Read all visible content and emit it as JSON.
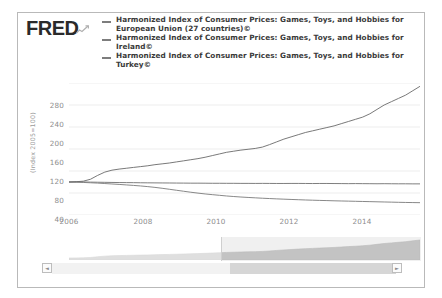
{
  "brand": {
    "logo_text": "FRED",
    "mark_icon": "mini-line-chart-icon"
  },
  "legend": {
    "position": "top",
    "entries": [
      {
        "marker": "line-dash",
        "label": "Harmonized Index of Consumer Prices: Games, Toys, and Hobbies for European Union (27 countries)©"
      },
      {
        "marker": "line-dash",
        "label": "Harmonized Index of Consumer Prices: Games, Toys, and Hobbies for Ireland©"
      },
      {
        "marker": "line-dash",
        "label": "Harmonized Index of Consumer Prices: Games, Toys, and Hobbies for Turkey©"
      }
    ]
  },
  "axis": {
    "y_label": "(Index 2005=100)",
    "y_ticks": [
      "280",
      "240",
      "200",
      "160",
      "120",
      "80",
      "40"
    ],
    "x_ticks": [
      "2006",
      "2008",
      "2010",
      "2012",
      "2014"
    ]
  },
  "navigator": {
    "scroll_left_label": "◄",
    "scroll_right_label": "►",
    "selection_start": "2010",
    "selection_end": "2015"
  },
  "colors": {
    "series_eu": "#6f6f6f",
    "series_ireland": "#7a7a7a",
    "series_turkey": "#6a6a6a",
    "gridline": "#ededed",
    "axis_text": "#8d8d8d",
    "frame": "#b9b9b9",
    "navigator_area": "#c9c9c9"
  },
  "chart_data": {
    "type": "line",
    "title": "",
    "xlabel": "",
    "ylabel": "(Index 2005=100)",
    "xlim": [
      2005.6,
      2015.4
    ],
    "ylim": [
      40,
      280
    ],
    "grid": true,
    "legend_position": "top",
    "x": [
      2005.6,
      2005.8,
      2006.0,
      2006.2,
      2006.4,
      2006.6,
      2006.8,
      2007.0,
      2007.2,
      2007.4,
      2007.6,
      2007.8,
      2008.0,
      2008.2,
      2008.4,
      2008.6,
      2008.8,
      2009.0,
      2009.2,
      2009.4,
      2009.6,
      2009.8,
      2010.0,
      2010.2,
      2010.4,
      2010.6,
      2010.8,
      2011.0,
      2011.2,
      2011.4,
      2011.6,
      2011.8,
      2012.0,
      2012.2,
      2012.4,
      2012.6,
      2012.8,
      2013.0,
      2013.2,
      2013.4,
      2013.6,
      2013.8,
      2014.0,
      2014.2,
      2014.4,
      2014.6,
      2014.8,
      2015.0,
      2015.2,
      2015.4
    ],
    "series": [
      {
        "name": "Harmonized Index of Consumer Prices: Games, Toys, and Hobbies for European Union (27 countries)©",
        "color": "#6f6f6f",
        "values": [
          100.0,
          100.2,
          100.1,
          99.8,
          99.6,
          99.4,
          99.2,
          99.0,
          98.9,
          98.8,
          98.6,
          98.5,
          98.4,
          98.3,
          98.2,
          98.1,
          98.0,
          97.9,
          97.9,
          97.8,
          97.7,
          97.7,
          97.6,
          97.6,
          97.5,
          97.5,
          97.4,
          97.5,
          97.4,
          97.3,
          97.3,
          97.4,
          97.4,
          97.3,
          97.2,
          97.3,
          97.3,
          97.2,
          97.1,
          97.0,
          97.1,
          97.0,
          96.9,
          96.8,
          96.9,
          96.8,
          96.7,
          96.7,
          96.6,
          96.6
        ]
      },
      {
        "name": "Harmonized Index of Consumer Prices: Games, Toys, and Hobbies for Ireland©",
        "color": "#7a7a7a",
        "values": [
          100.0,
          99.7,
          99.2,
          98.6,
          98.0,
          97.2,
          96.4,
          95.6,
          94.7,
          93.8,
          92.8,
          91.6,
          90.2,
          88.6,
          86.8,
          85.0,
          83.2,
          81.4,
          79.8,
          78.3,
          77.0,
          75.8,
          74.6,
          73.6,
          72.7,
          71.9,
          71.2,
          70.5,
          69.9,
          69.3,
          68.8,
          68.3,
          67.8,
          67.3,
          66.9,
          66.5,
          66.2,
          65.8,
          65.5,
          65.2,
          64.9,
          64.6,
          64.3,
          64.0,
          63.7,
          63.4,
          63.1,
          62.8,
          62.6,
          62.4
        ]
      },
      {
        "name": "Harmonized Index of Consumer Prices: Games, Toys, and Hobbies for Turkey©",
        "color": "#6a6a6a",
        "values": [
          100.0,
          100.5,
          101.5,
          105.0,
          112.0,
          118.0,
          121.5,
          123.5,
          125.0,
          126.5,
          128.0,
          129.5,
          131.5,
          133.0,
          134.5,
          136.5,
          138.5,
          140.5,
          142.5,
          145.0,
          148.0,
          151.0,
          154.0,
          156.0,
          158.0,
          159.5,
          161.0,
          163.5,
          168.0,
          173.0,
          178.0,
          182.0,
          186.0,
          190.0,
          193.0,
          196.0,
          199.0,
          202.0,
          206.0,
          210.0,
          214.0,
          218.0,
          224.0,
          232.0,
          240.0,
          246.0,
          252.0,
          258.0,
          266.0,
          274.0
        ]
      }
    ]
  }
}
